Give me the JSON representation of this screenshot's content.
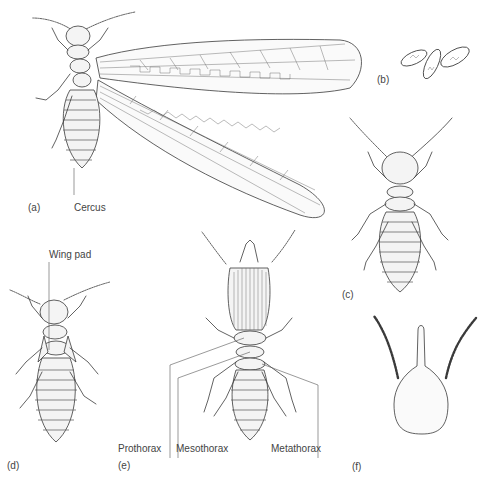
{
  "figure": {
    "panels": [
      {
        "id": "a",
        "label": "(a)",
        "description": "winged reproductive (alate)",
        "callouts": [
          "Cercus"
        ]
      },
      {
        "id": "b",
        "label": "(b)",
        "description": "eggs"
      },
      {
        "id": "c",
        "label": "(c)",
        "description": "worker"
      },
      {
        "id": "d",
        "label": "(d)",
        "description": "nymph",
        "callouts": [
          "Wing pad"
        ]
      },
      {
        "id": "e",
        "label": "(e)",
        "description": "soldier",
        "callouts": [
          "Prothorax",
          "Mesothorax",
          "Metathorax"
        ]
      },
      {
        "id": "f",
        "label": "(f)",
        "description": "nasute soldier head"
      }
    ]
  },
  "labels": {
    "a": "(a)",
    "b": "(b)",
    "c": "(c)",
    "d": "(d)",
    "e": "(e)",
    "f": "(f)",
    "cercus": "Cercus",
    "wing_pad": "Wing pad",
    "prothorax": "Prothorax",
    "mesothorax": "Mesothorax",
    "metathorax": "Metathorax"
  },
  "colors": {
    "ink": "#3a3a3a",
    "fill": "#f4f4f4",
    "background": "#ffffff"
  }
}
